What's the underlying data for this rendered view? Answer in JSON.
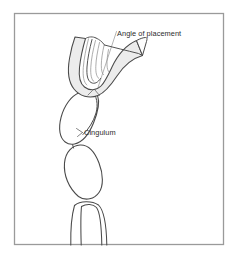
{
  "figure": {
    "kind": "dental-line-diagram",
    "frame": {
      "border_color": "#9a9a9a",
      "fill_color": "#ffffff",
      "x": 14,
      "y": 13,
      "width": 210,
      "height": 232
    },
    "style": {
      "outline_color": "#3a3a3a",
      "leader_color": "#7d7d7d",
      "clasp_fill": "#ececec",
      "stripe_color": "#8a8a8a",
      "text_color": "#2b2b2b"
    }
  },
  "labels": {
    "angle_of_placement": {
      "text": "Angle of placement",
      "x": 117,
      "y": 36
    },
    "cingulum": {
      "text": "Cingulum",
      "x": 84,
      "y": 132
    }
  },
  "parts": {
    "clasp_arm": "clasp-arm",
    "clasp_tines": "clasp-tines",
    "crown": "tooth-crown",
    "cingulum_bulge": "cingulum-bulge",
    "root_body": "tooth-root-body",
    "root_bifurcation": "root-bifurcation"
  }
}
